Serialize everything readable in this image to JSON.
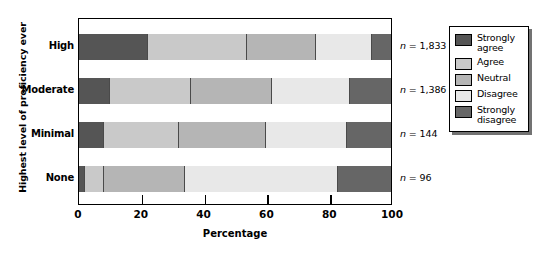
{
  "chart_data": {
    "type": "bar",
    "orientation": "horizontal",
    "stacked": true,
    "normalized_percent": true,
    "title": "",
    "xlabel": "Percentage",
    "ylabel": "Highest level of proficiency ever",
    "xlim": [
      0,
      100
    ],
    "xticks": [
      0,
      20,
      40,
      60,
      80,
      100
    ],
    "xtick_labels": [
      "0",
      "20",
      "40",
      "60",
      "80",
      "100"
    ],
    "grid": false,
    "legend_position": "right",
    "categories": [
      "High",
      "Moderate",
      "Minimal",
      "None"
    ],
    "series": [
      {
        "name": "Strongly agree",
        "color": "#555555",
        "values": [
          22,
          10,
          8,
          2
        ]
      },
      {
        "name": "Agree",
        "color": "#c9c9c9",
        "values": [
          32,
          26,
          24,
          6
        ]
      },
      {
        "name": "Neutral",
        "color": "#b5b5b5",
        "values": [
          22,
          26,
          28,
          26
        ]
      },
      {
        "name": "Disagree",
        "color": "#e8e8e8",
        "values": [
          18,
          25,
          26,
          49
        ]
      },
      {
        "name": "Strongly disagree",
        "color": "#666666",
        "values": [
          6,
          13,
          14,
          17
        ]
      }
    ],
    "annotations": [
      {
        "category": "High",
        "text": "n = 1,833"
      },
      {
        "category": "Moderate",
        "text": "n = 1,386"
      },
      {
        "category": "Minimal",
        "text": "n = 144"
      },
      {
        "category": "None",
        "text": "n = 96"
      }
    ]
  },
  "axis": {
    "y_title": "Highest level of proficiency ever",
    "x_title": "Percentage",
    "category_labels": [
      "High",
      "Moderate",
      "Minimal",
      "None"
    ],
    "x_tick_labels": [
      "0",
      "20",
      "40",
      "60",
      "80",
      "100"
    ]
  },
  "annotations": {
    "n_labels": [
      "n = 1,833",
      "n = 1,386",
      "n = 144",
      "n = 96"
    ]
  },
  "legend": {
    "items": [
      {
        "label": "Strongly agree",
        "color": "#555555"
      },
      {
        "label": "Agree",
        "color": "#c9c9c9"
      },
      {
        "label": "Neutral",
        "color": "#b5b5b5"
      },
      {
        "label": "Disagree",
        "color": "#e8e8e8"
      },
      {
        "label": "Strongly disagree",
        "color": "#666666"
      }
    ]
  }
}
